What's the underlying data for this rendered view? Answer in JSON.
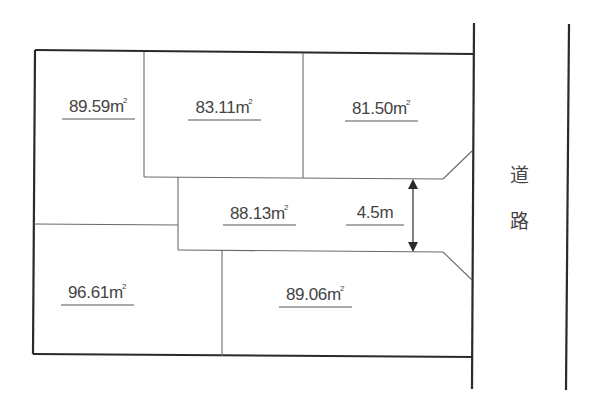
{
  "lots": [
    {
      "id": "lot-1",
      "area": "89.59",
      "unit": "m",
      "unit_sup": "2"
    },
    {
      "id": "lot-2",
      "area": "83.11",
      "unit": "m",
      "unit_sup": "2"
    },
    {
      "id": "lot-3",
      "area": "81.50",
      "unit": "m",
      "unit_sup": "2"
    },
    {
      "id": "lot-4",
      "area": "88.13",
      "unit": "m",
      "unit_sup": "2"
    },
    {
      "id": "lot-5",
      "area": "96.61",
      "unit": "m",
      "unit_sup": "2"
    },
    {
      "id": "lot-6",
      "area": "89.06",
      "unit": "m",
      "unit_sup": "2"
    }
  ],
  "private_road": {
    "width_label": "4.5m"
  },
  "road": {
    "char1": "道",
    "char2": "路"
  },
  "colors": {
    "thick_line": "#2a2a2a",
    "thin_line": "#6a6a6a",
    "text": "#444444"
  }
}
